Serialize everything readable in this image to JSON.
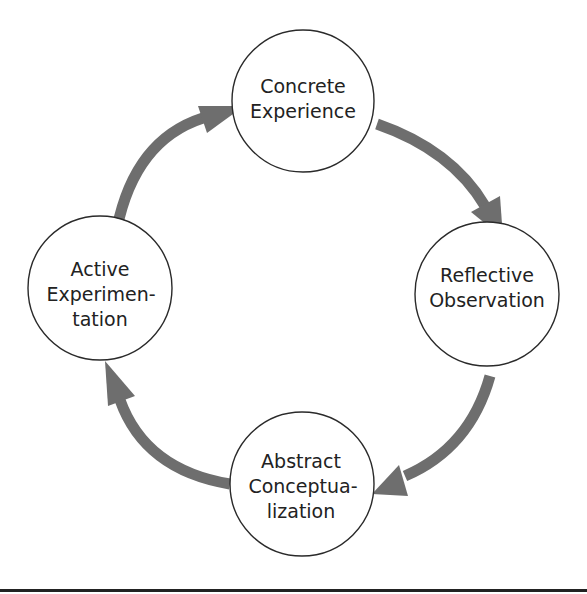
{
  "diagram": {
    "type": "cycle",
    "colors": {
      "arrow": "#6e6e6e",
      "circle_stroke": "#2a2a2a",
      "text": "#222222",
      "rule": "#222222"
    },
    "nodes": [
      {
        "id": "concrete-experience",
        "lines": [
          "Concrete",
          "Experience"
        ]
      },
      {
        "id": "reflective-observation",
        "lines": [
          "Reflective",
          "Observation"
        ]
      },
      {
        "id": "abstract-conceptualization",
        "lines": [
          "Abstract",
          "Conceptua-",
          "lization"
        ]
      },
      {
        "id": "active-experimentation",
        "lines": [
          "Active",
          "Experimen-",
          "tation"
        ]
      }
    ],
    "edges": [
      {
        "from": "concrete-experience",
        "to": "reflective-observation"
      },
      {
        "from": "reflective-observation",
        "to": "abstract-conceptualization"
      },
      {
        "from": "abstract-conceptualization",
        "to": "active-experimentation"
      },
      {
        "from": "active-experimentation",
        "to": "concrete-experience"
      }
    ]
  }
}
